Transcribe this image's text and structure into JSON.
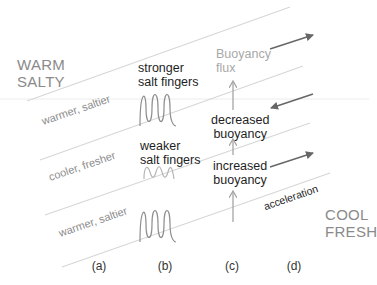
{
  "water_masses": {
    "top": {
      "line1": "WARM",
      "line2": "SALTY"
    },
    "bottom": {
      "line1": "COOL",
      "line2": "FRESH"
    }
  },
  "layers": [
    {
      "label": "warmer, saltier"
    },
    {
      "label": "cooler, fresher"
    },
    {
      "label": "warmer, saltier"
    }
  ],
  "salt_fingers": {
    "strong": {
      "line1": "stronger",
      "line2": "salt fingers"
    },
    "weak": {
      "line1": "weaker",
      "line2": "salt fingers"
    }
  },
  "buoyancy": {
    "flux": {
      "line1": "Buoyancy",
      "line2": "flux"
    },
    "decreased": {
      "line1": "decreased",
      "line2": "buoyancy"
    },
    "increased": {
      "line1": "increased",
      "line2": "buoyancy"
    }
  },
  "acceleration_label": "acceleration",
  "panels": [
    "(a)",
    "(b)",
    "(c)",
    "(d)"
  ],
  "colors": {
    "isopycnal_line": "#d6d6d6",
    "horizontal_line": "#ececec",
    "wave_strong": "#8f8f8f",
    "wave_weak": "#b5b5b5",
    "arrow_vertical": "#a5a5a5",
    "arrow_horizontal": "#666666"
  }
}
